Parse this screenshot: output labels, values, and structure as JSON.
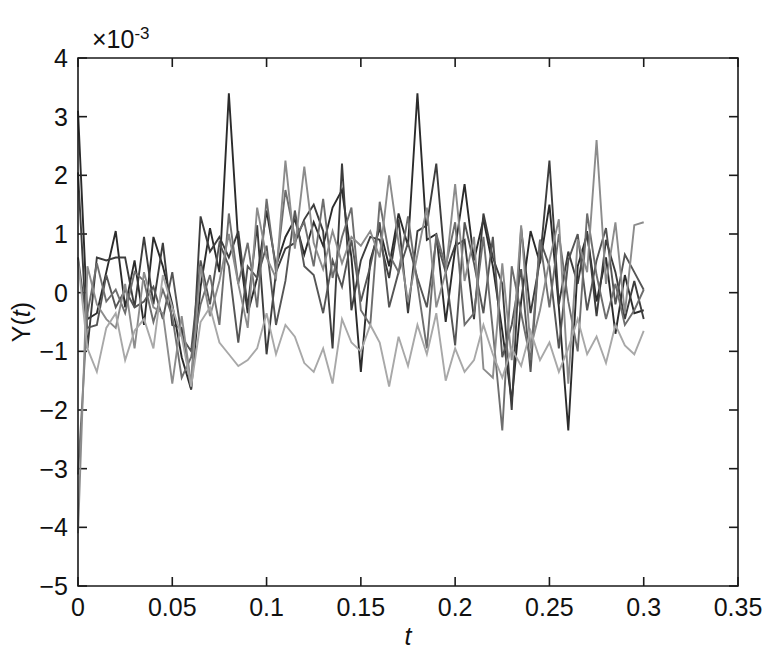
{
  "chart_data": {
    "type": "line",
    "title": "",
    "subtitle": "",
    "xlabel": "t",
    "ylabel": "Y(t)",
    "multiplier_label": "×10",
    "multiplier_exponent": "-3",
    "y_scale_factor": 0.001,
    "xlim": [
      0,
      0.35
    ],
    "ylim": [
      -5,
      4
    ],
    "grid": false,
    "legend": null,
    "legend_position": "none",
    "xticks": [
      0,
      0.05,
      0.1,
      0.15,
      0.2,
      0.25,
      0.3,
      0.35
    ],
    "xtick_labels": [
      "0",
      "0.05",
      "0.1",
      "0.15",
      "0.2",
      "0.25",
      "0.3",
      "0.35"
    ],
    "yticks": [
      -5,
      -4,
      -3,
      -2,
      -1,
      0,
      1,
      2,
      3,
      4
    ],
    "ytick_labels": [
      "−5",
      "−4",
      "−3",
      "−2",
      "−1",
      "0",
      "1",
      "2",
      "3",
      "4"
    ],
    "x_step": 0.005,
    "x": [
      0,
      0.005,
      0.01,
      0.015,
      0.02,
      0.025,
      0.03,
      0.035,
      0.04,
      0.045,
      0.05,
      0.055,
      0.06,
      0.065,
      0.07,
      0.075,
      0.08,
      0.085,
      0.09,
      0.095,
      0.1,
      0.105,
      0.11,
      0.115,
      0.12,
      0.125,
      0.13,
      0.135,
      0.14,
      0.145,
      0.15,
      0.155,
      0.16,
      0.165,
      0.17,
      0.175,
      0.18,
      0.185,
      0.19,
      0.195,
      0.2,
      0.205,
      0.21,
      0.215,
      0.22,
      0.225,
      0.23,
      0.235,
      0.24,
      0.245,
      0.25,
      0.255,
      0.26,
      0.265,
      0.27,
      0.275,
      0.28,
      0.285,
      0.29,
      0.295,
      0.3
    ],
    "series": [
      {
        "name": "series-1",
        "color": "#2b2b2b",
        "width": 1.9,
        "values": [
          3.1,
          -0.45,
          -0.35,
          0.35,
          1.05,
          -0.25,
          0.55,
          -0.55,
          0.95,
          0.45,
          -0.2,
          -1.1,
          -1.65,
          0.1,
          1.1,
          0.35,
          3.4,
          0.85,
          -0.35,
          0.25,
          1.4,
          0.45,
          0.95,
          1.25,
          0.65,
          1.2,
          0.8,
          1.45,
          1.75,
          0.6,
          -1.35,
          0.55,
          1.1,
          0.45,
          1.35,
          0.8,
          3.4,
          0.9,
          1.0,
          -0.5,
          0.75,
          1.85,
          0.55,
          1.25,
          0.45,
          -0.65,
          -1.85,
          -0.15,
          1.05,
          0.5,
          1.5,
          -0.25,
          -2.35,
          0.45,
          1.0,
          -0.15,
          0.6,
          -0.7,
          0.3,
          -0.35,
          -0.3
        ]
      },
      {
        "name": "series-2",
        "color": "#3d3d3d",
        "width": 1.9,
        "values": [
          2.05,
          -0.95,
          0.6,
          0.55,
          0.6,
          0.6,
          -0.25,
          0.95,
          -0.2,
          0.85,
          -0.55,
          -0.6,
          -1.65,
          1.3,
          0.7,
          0.95,
          0.6,
          1.05,
          -0.25,
          1.15,
          -1.05,
          0.35,
          0.75,
          0.85,
          1.25,
          1.5,
          1.05,
          -0.95,
          2.2,
          -0.3,
          0.55,
          0.95,
          0.9,
          0.25,
          1.25,
          -0.35,
          1.05,
          1.15,
          2.2,
          0.35,
          0.8,
          0.9,
          -0.45,
          1.35,
          0.6,
          0.15,
          -2.0,
          1.1,
          -0.35,
          0.55,
          2.25,
          -0.2,
          0.7,
          0.15,
          1.05,
          -0.4,
          0.9,
          0.35,
          -0.45,
          0.2,
          -0.45
        ]
      },
      {
        "name": "series-3",
        "color": "#555555",
        "width": 1.9,
        "values": [
          0.6,
          -0.6,
          -0.55,
          0.3,
          -0.25,
          0.05,
          -0.25,
          -0.15,
          0.1,
          -0.45,
          0.35,
          -0.75,
          -1.0,
          0.55,
          -0.2,
          0.85,
          0.45,
          -0.85,
          0.45,
          0.25,
          0.8,
          -0.55,
          0.2,
          1.4,
          0.45,
          0.3,
          -0.35,
          0.55,
          0.1,
          0.9,
          -0.15,
          0.45,
          1.2,
          -0.25,
          0.35,
          0.85,
          0.25,
          -0.25,
          0.9,
          0.35,
          -0.9,
          1.2,
          0.5,
          -0.35,
          0.95,
          -1.1,
          -0.55,
          0.4,
          -1.35,
          0.9,
          0.45,
          -0.95,
          0.55,
          1.0,
          -0.3,
          0.55,
          1.1,
          -0.2,
          0.65,
          0.35,
          0.05
        ]
      },
      {
        "name": "series-4",
        "color": "#6e6e6e",
        "width": 1.9,
        "values": [
          -3.1,
          -0.35,
          0.5,
          -0.15,
          0.05,
          -0.35,
          0.35,
          0.2,
          -0.5,
          0.05,
          -0.4,
          -1.45,
          -1.1,
          -0.2,
          0.3,
          -0.55,
          1.35,
          0.15,
          0.85,
          -0.25,
          1.6,
          0.35,
          1.75,
          0.95,
          1.2,
          0.45,
          1.6,
          0.25,
          0.95,
          1.45,
          -0.3,
          -0.55,
          1.55,
          0.65,
          0.35,
          1.3,
          0.15,
          -0.95,
          1.0,
          0.45,
          1.2,
          -0.55,
          -0.35,
          0.95,
          -0.65,
          -2.35,
          0.45,
          -0.35,
          -1.15,
          0.9,
          -0.25,
          1.0,
          -0.15,
          -1.0,
          1.35,
          0.3,
          -0.45,
          0.15,
          -0.55,
          -0.3,
          0.05
        ]
      },
      {
        "name": "series-5",
        "color": "#8c8c8c",
        "width": 1.9,
        "values": [
          -4.1,
          0.45,
          -0.2,
          -0.45,
          -0.6,
          0.15,
          -0.95,
          0.35,
          -0.25,
          -0.35,
          -1.55,
          -0.4,
          -1.55,
          0.45,
          -0.4,
          0.2,
          1.0,
          0.15,
          -0.6,
          1.45,
          0.6,
          0.25,
          2.25,
          0.75,
          2.15,
          0.85,
          0.4,
          1.05,
          0.5,
          0.95,
          0.8,
          1.05,
          0.6,
          2.0,
          0.85,
          -0.15,
          0.65,
          1.45,
          -0.25,
          0.35,
          1.85,
          0.2,
          0.95,
          -1.3,
          -1.45,
          0.5,
          -1.15,
          1.15,
          -0.95,
          -0.3,
          0.55,
          1.25,
          -1.55,
          0.9,
          0.35,
          2.6,
          0.15,
          1.2,
          -0.35,
          1.15,
          1.2
        ]
      },
      {
        "name": "series-6",
        "color": "#a8a8a8",
        "width": 1.9,
        "values": [
          0.55,
          -0.95,
          -1.35,
          -0.6,
          -0.35,
          -1.15,
          -0.65,
          -0.45,
          -0.95,
          0.3,
          -0.25,
          -0.75,
          -1.6,
          -0.5,
          -0.25,
          -0.85,
          -1.05,
          -1.25,
          -1.15,
          -0.95,
          -0.35,
          -1.05,
          -0.55,
          -0.75,
          -1.2,
          -1.35,
          -0.95,
          -1.55,
          -0.45,
          -0.85,
          -1.0,
          -0.55,
          -0.85,
          -1.6,
          -0.75,
          -1.25,
          -0.55,
          -1.05,
          -0.35,
          -1.5,
          -0.95,
          -1.35,
          -1.15,
          -0.55,
          -1.05,
          -1.45,
          -0.95,
          -1.25,
          -0.65,
          -1.15,
          -0.85,
          -1.35,
          -0.95,
          -0.45,
          -1.05,
          -0.75,
          -1.2,
          -0.55,
          -0.9,
          -1.05,
          -0.65
        ]
      }
    ]
  },
  "figure": {
    "background_color": "#ffffff",
    "axis_color": "#1a1a1a"
  }
}
